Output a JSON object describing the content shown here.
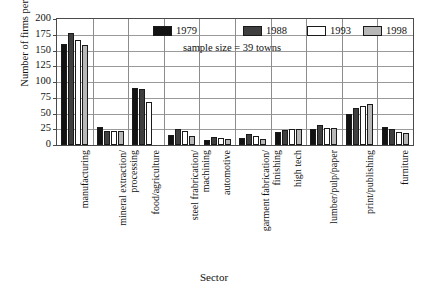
{
  "top_caption_sliver": "",
  "axes": {
    "ylabel": "Number of firms per sector",
    "xlabel": "Sector",
    "yticks": [
      "200",
      "175",
      "150",
      "125",
      "100",
      "75",
      "50",
      "25",
      "0"
    ]
  },
  "legend": [
    {
      "label": "1979",
      "color": "#121212"
    },
    {
      "label": "1988",
      "color": "#3f3f3f"
    },
    {
      "label": "1993",
      "color": "#ffffff"
    },
    {
      "label": "1998",
      "color": "#b8b8b8"
    }
  ],
  "annotation": "sample size = 39 towns",
  "categories_display": [
    [
      "manufacturing"
    ],
    [
      "mineral extraction/",
      "processing"
    ],
    [
      "food/agriculture"
    ],
    [
      "steel frabrication/",
      "machining"
    ],
    [
      "automotive"
    ],
    [
      "garment fabrication/",
      "finishing"
    ],
    [
      "high tech"
    ],
    [
      "lumber/pulp/paper"
    ],
    [
      "print/publishing"
    ],
    [
      "furniture"
    ]
  ],
  "chart_data": {
    "type": "bar",
    "title": "",
    "xlabel": "Sector",
    "ylabel": "Number of firms per sector",
    "ylim": [
      0,
      200
    ],
    "ytick_step": 25,
    "grid": true,
    "legend_position": "top-inside",
    "annotation": "sample size = 39 towns",
    "categories": [
      "manufacturing",
      "mineral extraction/processing",
      "food/agriculture",
      "steel frabrication/machining",
      "automotive",
      "garment fabrication/finishing",
      "high tech",
      "lumber/pulp/paper",
      "print/publishing",
      "furniture"
    ],
    "series": [
      {
        "name": "1979",
        "values": [
          161,
          29,
          91,
          16,
          8,
          11,
          21,
          26,
          50,
          29
        ]
      },
      {
        "name": "1988",
        "values": [
          178,
          23,
          89,
          25,
          12,
          17,
          24,
          31,
          58,
          25
        ]
      },
      {
        "name": "1993",
        "values": [
          167,
          22,
          68,
          22,
          11,
          14,
          26,
          27,
          62,
          20
        ]
      },
      {
        "name": "1998",
        "values": [
          158,
          22,
          0,
          14,
          9,
          10,
          26,
          27,
          65,
          19
        ]
      }
    ]
  }
}
